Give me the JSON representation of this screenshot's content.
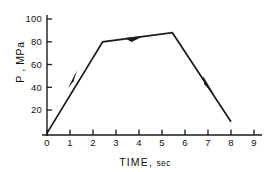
{
  "chart_data": {
    "type": "line",
    "title": "",
    "xlabel": "TIME , sec",
    "ylabel": "P , MPa",
    "xlabel_main": "TIME",
    "xlabel_comma": ",",
    "xlabel_unit": "sec",
    "ylabel_symbol": "P",
    "ylabel_unit": "MPa",
    "xlim": [
      0,
      9.4
    ],
    "ylim": [
      0,
      108
    ],
    "xticks": [
      0,
      1,
      2,
      3,
      4,
      5,
      6,
      7,
      8,
      9
    ],
    "xtick_labels": [
      "0",
      "1",
      "2",
      "3",
      "4",
      "5",
      "6",
      "7",
      "8",
      "9"
    ],
    "yticks": [
      20,
      40,
      60,
      80,
      100
    ],
    "ytick_labels": [
      "20",
      "40",
      "60",
      "80",
      "100"
    ],
    "grid": false,
    "legend": false,
    "line_color": "#1a1a1a",
    "axis_color": "#1a1a1a",
    "series": [
      {
        "name": "pressure-time profile",
        "x": [
          0.0,
          2.42,
          5.45,
          8.0
        ],
        "values": [
          0,
          80,
          88,
          10
        ]
      }
    ],
    "annotations": [
      {
        "name": "arrow-loading",
        "x": 1.32,
        "y": 43,
        "direction": "up-right"
      },
      {
        "name": "arrow-hold",
        "x": 3.85,
        "y": 83,
        "direction": "right"
      },
      {
        "name": "arrow-unloading",
        "x": 6.82,
        "y": 46,
        "direction": "down-right"
      }
    ]
  }
}
